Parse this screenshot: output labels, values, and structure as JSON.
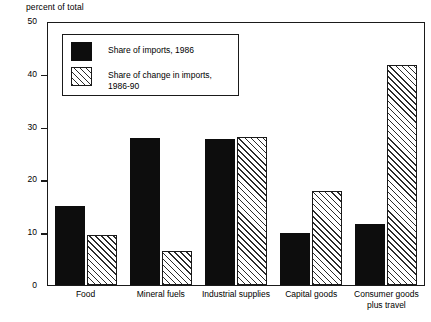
{
  "chart_data": {
    "type": "bar",
    "title": "",
    "subtitle": "",
    "xlabel": "",
    "ylabel": "percent of total",
    "ylim": [
      0,
      50
    ],
    "yticks": [
      0,
      10,
      20,
      30,
      40,
      50
    ],
    "grid": false,
    "legend_position": "upper-left-inside",
    "categories": [
      "Food",
      "Mineral fuels",
      "Industrial supplies",
      "Capital goods",
      "Consumer goods\nplus travel"
    ],
    "series": [
      {
        "name": "Share of imports, 1986",
        "style": "solid-black",
        "values": [
          15.0,
          28.0,
          27.8,
          9.9,
          11.7
        ]
      },
      {
        "name": "Share of change in imports,\n1986-90",
        "style": "diagonal-hatch",
        "values": [
          9.5,
          6.5,
          28.2,
          18.0,
          42.0
        ]
      }
    ]
  },
  "legend": {
    "items": [
      {
        "label": "Share of imports, 1986"
      },
      {
        "label": "Share of change in imports,\n1986-90"
      }
    ]
  },
  "colors": {
    "series_1": "#0d0d0d",
    "series_2_line": "#2b2b2b",
    "series_2_fill": "#ffffff",
    "axis": "#1a1a1a",
    "background": "#ffffff"
  }
}
